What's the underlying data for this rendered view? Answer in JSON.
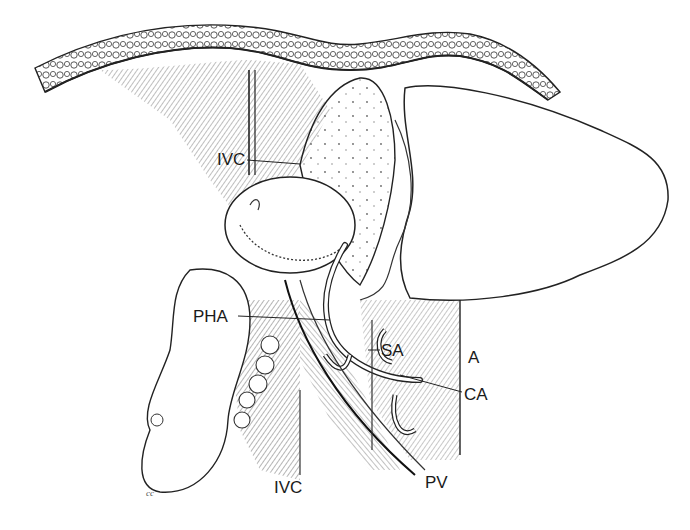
{
  "figure": {
    "type": "anatomical-illustration",
    "style": "pen-and-ink line drawing",
    "colors": {
      "ink": "#1a1a1a",
      "hatch": "#444444",
      "fill": "#ffffff"
    },
    "labels": [
      {
        "id": "ivc_top",
        "text": "IVC",
        "x": 217,
        "y": 151,
        "leader": [
          [
            247,
            160
          ],
          [
            300,
            164
          ]
        ]
      },
      {
        "id": "pha",
        "text": "PHA",
        "x": 193,
        "y": 308,
        "leader": [
          [
            238,
            316
          ],
          [
            330,
            320
          ]
        ]
      },
      {
        "id": "sa",
        "text": "SA",
        "x": 381,
        "y": 342,
        "leader": [
          [
            380,
            350
          ],
          [
            368,
            350
          ]
        ]
      },
      {
        "id": "a",
        "text": "A",
        "x": 468,
        "y": 349,
        "leader": null
      },
      {
        "id": "ca",
        "text": "CA",
        "x": 464,
        "y": 386,
        "leader": [
          [
            462,
            392
          ],
          [
            400,
            375
          ]
        ]
      },
      {
        "id": "ivc_bottom",
        "text": "IVC",
        "x": 274,
        "y": 479,
        "leader": null
      },
      {
        "id": "pv",
        "text": "PV",
        "x": 425,
        "y": 474,
        "leader": null
      }
    ],
    "signature": {
      "text": "cc",
      "x": 146,
      "y": 488
    }
  }
}
